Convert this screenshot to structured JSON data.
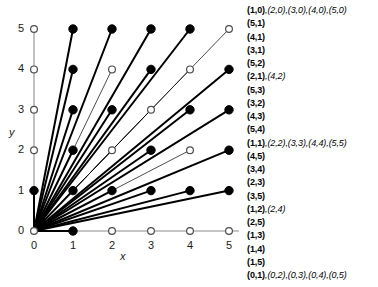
{
  "figure": {
    "axes": {
      "x_label": "x",
      "y_label": "y",
      "x_ticks": [
        "0",
        "1",
        "2",
        "3",
        "4",
        "5"
      ],
      "y_ticks": [
        "0",
        "1",
        "2",
        "3",
        "4",
        "5"
      ]
    },
    "colors": {
      "ray": "#000000",
      "axis": "#8c8c8c",
      "filled_point": "#000000",
      "open_point_stroke": "#4d4d4d",
      "open_point_fill": "#ffffff",
      "text": "#000000"
    }
  },
  "chart_data": {
    "type": "scatter",
    "title": "",
    "xlabel": "x",
    "ylabel": "y",
    "xlim": [
      0,
      5
    ],
    "ylim": [
      0,
      5
    ],
    "grid": false,
    "legend": "none",
    "points": [
      {
        "x": 0,
        "y": 0,
        "filled": false
      },
      {
        "x": 1,
        "y": 0,
        "filled": true
      },
      {
        "x": 2,
        "y": 0,
        "filled": false
      },
      {
        "x": 3,
        "y": 0,
        "filled": false
      },
      {
        "x": 4,
        "y": 0,
        "filled": false
      },
      {
        "x": 5,
        "y": 0,
        "filled": false
      },
      {
        "x": 0,
        "y": 1,
        "filled": true
      },
      {
        "x": 1,
        "y": 1,
        "filled": true
      },
      {
        "x": 2,
        "y": 1,
        "filled": true
      },
      {
        "x": 3,
        "y": 1,
        "filled": true
      },
      {
        "x": 4,
        "y": 1,
        "filled": true
      },
      {
        "x": 5,
        "y": 1,
        "filled": true
      },
      {
        "x": 0,
        "y": 2,
        "filled": false
      },
      {
        "x": 1,
        "y": 2,
        "filled": true
      },
      {
        "x": 2,
        "y": 2,
        "filled": false
      },
      {
        "x": 3,
        "y": 2,
        "filled": true
      },
      {
        "x": 4,
        "y": 2,
        "filled": false
      },
      {
        "x": 5,
        "y": 2,
        "filled": true
      },
      {
        "x": 0,
        "y": 3,
        "filled": false
      },
      {
        "x": 1,
        "y": 3,
        "filled": true
      },
      {
        "x": 2,
        "y": 3,
        "filled": true
      },
      {
        "x": 3,
        "y": 3,
        "filled": false
      },
      {
        "x": 4,
        "y": 3,
        "filled": true
      },
      {
        "x": 5,
        "y": 3,
        "filled": true
      },
      {
        "x": 0,
        "y": 4,
        "filled": false
      },
      {
        "x": 1,
        "y": 4,
        "filled": true
      },
      {
        "x": 2,
        "y": 4,
        "filled": false
      },
      {
        "x": 3,
        "y": 4,
        "filled": true
      },
      {
        "x": 4,
        "y": 4,
        "filled": false
      },
      {
        "x": 5,
        "y": 4,
        "filled": true
      },
      {
        "x": 0,
        "y": 5,
        "filled": false
      },
      {
        "x": 1,
        "y": 5,
        "filled": true
      },
      {
        "x": 2,
        "y": 5,
        "filled": true
      },
      {
        "x": 3,
        "y": 5,
        "filled": true
      },
      {
        "x": 4,
        "y": 5,
        "filled": true
      },
      {
        "x": 5,
        "y": 5,
        "filled": false
      }
    ],
    "rays": [
      {
        "x": 1,
        "y": 0,
        "thick": true
      },
      {
        "x": 5,
        "y": 1,
        "thick": true
      },
      {
        "x": 4,
        "y": 1,
        "thick": true
      },
      {
        "x": 3,
        "y": 1,
        "thick": true
      },
      {
        "x": 5,
        "y": 2,
        "thick": true
      },
      {
        "x": 2,
        "y": 1,
        "thick": true
      },
      {
        "x": 4,
        "y": 2,
        "thick": false
      },
      {
        "x": 5,
        "y": 3,
        "thick": true
      },
      {
        "x": 3,
        "y": 2,
        "thick": true
      },
      {
        "x": 4,
        "y": 3,
        "thick": true
      },
      {
        "x": 5,
        "y": 4,
        "thick": true
      },
      {
        "x": 1,
        "y": 1,
        "thick": true
      },
      {
        "x": 2,
        "y": 2,
        "thick": false
      },
      {
        "x": 3,
        "y": 3,
        "thick": false
      },
      {
        "x": 4,
        "y": 4,
        "thick": false
      },
      {
        "x": 5,
        "y": 5,
        "thick": false
      },
      {
        "x": 4,
        "y": 5,
        "thick": true
      },
      {
        "x": 3,
        "y": 4,
        "thick": true
      },
      {
        "x": 2,
        "y": 3,
        "thick": true
      },
      {
        "x": 3,
        "y": 5,
        "thick": true
      },
      {
        "x": 1,
        "y": 2,
        "thick": true
      },
      {
        "x": 2,
        "y": 4,
        "thick": false
      },
      {
        "x": 2,
        "y": 5,
        "thick": true
      },
      {
        "x": 1,
        "y": 3,
        "thick": true
      },
      {
        "x": 1,
        "y": 4,
        "thick": true
      },
      {
        "x": 1,
        "y": 5,
        "thick": true
      },
      {
        "x": 0,
        "y": 1,
        "thick": true
      }
    ]
  },
  "list": {
    "lines": [
      {
        "primary": "(1,0)",
        "multiples": ",(2,0),(3,0),(4,0),(5,0)"
      },
      {
        "primary": "(5,1)",
        "multiples": ""
      },
      {
        "primary": "(4,1)",
        "multiples": ""
      },
      {
        "primary": "(3,1)",
        "multiples": ""
      },
      {
        "primary": "(5,2)",
        "multiples": ""
      },
      {
        "primary": "(2,1)",
        "multiples": ",(4,2)"
      },
      {
        "primary": "(5,3)",
        "multiples": ""
      },
      {
        "primary": "(3,2)",
        "multiples": ""
      },
      {
        "primary": "(4,3)",
        "multiples": ""
      },
      {
        "primary": "(5,4)",
        "multiples": ""
      },
      {
        "primary": "(1,1)",
        "multiples": ",(2,2),(3,3),(4,4),(5,5)"
      },
      {
        "primary": "(4,5)",
        "multiples": ""
      },
      {
        "primary": "(3,4)",
        "multiples": ""
      },
      {
        "primary": "(2,3)",
        "multiples": ""
      },
      {
        "primary": "(3,5)",
        "multiples": ""
      },
      {
        "primary": "(1,2)",
        "multiples": ",(2,4)"
      },
      {
        "primary": "(2,5)",
        "multiples": ""
      },
      {
        "primary": "(1,3)",
        "multiples": ""
      },
      {
        "primary": "(1,4)",
        "multiples": ""
      },
      {
        "primary": "(1,5)",
        "multiples": ""
      },
      {
        "primary": "(0,1)",
        "multiples": ",(0,2),(0,3),(0,4),(0,5)"
      }
    ]
  }
}
